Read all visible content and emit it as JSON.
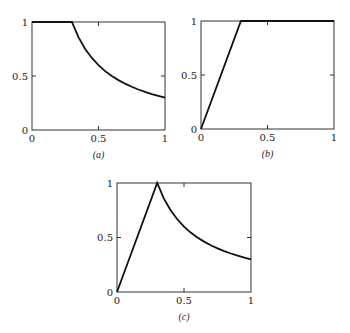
{
  "chart_data": [
    {
      "id": "a",
      "type": "line",
      "caption": "(a)",
      "box": {
        "x0": 32,
        "y0": 22,
        "x1": 165,
        "y1": 130
      },
      "xlim": [
        0,
        1
      ],
      "ylim": [
        0,
        1
      ],
      "xticks": [
        {
          "v": 0,
          "label": "0"
        },
        {
          "v": 0.5,
          "label": "0.5"
        },
        {
          "v": 1,
          "label": "1"
        }
      ],
      "yticks": [
        {
          "v": 0,
          "label": "0"
        },
        {
          "v": 0.5,
          "label": "0.5"
        },
        {
          "v": 1,
          "label": "1"
        }
      ],
      "grid": false,
      "series": [
        {
          "name": "curve-a",
          "description": "y = 1 for x <= 0.3, y = 0.3/x for x > 0.3",
          "x": [
            0,
            0.3,
            0.35,
            0.4,
            0.45,
            0.5,
            0.55,
            0.6,
            0.65,
            0.7,
            0.75,
            0.8,
            0.85,
            0.9,
            0.95,
            1.0
          ],
          "y": [
            1,
            1,
            0.857,
            0.75,
            0.667,
            0.6,
            0.545,
            0.5,
            0.462,
            0.429,
            0.4,
            0.375,
            0.353,
            0.333,
            0.316,
            0.3
          ]
        }
      ]
    },
    {
      "id": "b",
      "type": "line",
      "caption": "(b)",
      "box": {
        "x0": 201,
        "y0": 21,
        "x1": 334,
        "y1": 129
      },
      "xlim": [
        0,
        1
      ],
      "ylim": [
        0,
        1
      ],
      "xticks": [
        {
          "v": 0,
          "label": "0"
        },
        {
          "v": 0.5,
          "label": "0.5"
        },
        {
          "v": 1,
          "label": "1"
        }
      ],
      "yticks": [
        {
          "v": 0,
          "label": "0"
        },
        {
          "v": 0.5,
          "label": "0.5"
        },
        {
          "v": 1,
          "label": "1"
        }
      ],
      "grid": false,
      "series": [
        {
          "name": "curve-b",
          "description": "y = x/0.3 for x <= 0.3, y = 1 for x > 0.3",
          "x": [
            0,
            0.3,
            1.0
          ],
          "y": [
            0,
            1,
            1
          ]
        }
      ]
    },
    {
      "id": "c",
      "type": "line",
      "caption": "(c)",
      "box": {
        "x0": 117,
        "y0": 183,
        "x1": 251,
        "y1": 292
      },
      "xlim": [
        0,
        1
      ],
      "ylim": [
        0,
        1
      ],
      "xticks": [
        {
          "v": 0,
          "label": "0"
        },
        {
          "v": 0.5,
          "label": "0.5"
        },
        {
          "v": 1,
          "label": "1"
        }
      ],
      "yticks": [
        {
          "v": 0,
          "label": "0"
        },
        {
          "v": 0.5,
          "label": "0.5"
        },
        {
          "v": 1,
          "label": "1"
        }
      ],
      "grid": false,
      "series": [
        {
          "name": "curve-c",
          "description": "y = x/0.3 for x <= 0.3, y = 0.3/x for x > 0.3",
          "x": [
            0,
            0.3,
            0.35,
            0.4,
            0.45,
            0.5,
            0.55,
            0.6,
            0.65,
            0.7,
            0.75,
            0.8,
            0.85,
            0.9,
            0.95,
            1.0
          ],
          "y": [
            0,
            1,
            0.857,
            0.75,
            0.667,
            0.6,
            0.545,
            0.5,
            0.462,
            0.429,
            0.4,
            0.375,
            0.353,
            0.333,
            0.316,
            0.3
          ]
        }
      ]
    }
  ]
}
